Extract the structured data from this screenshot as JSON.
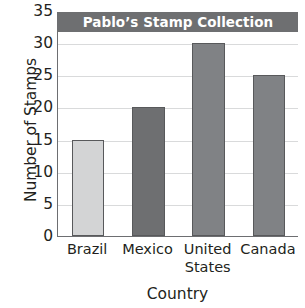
{
  "chart_data": {
    "type": "bar",
    "title": "Pablo’s Stamp Collection",
    "xlabel": "Country",
    "ylabel": "Number of Stamps",
    "categories": [
      "Brazil",
      "Mexico",
      "United States",
      "Canada"
    ],
    "values": [
      15,
      20,
      30,
      25
    ],
    "bar_colors": [
      "#d3d4d5",
      "#6e6f71",
      "#808285",
      "#808285"
    ],
    "ylim": [
      0,
      35
    ],
    "ytick_labels": [
      "0",
      "5",
      "10",
      "15",
      "20",
      "25",
      "30",
      "35"
    ],
    "ytick_values": [
      0,
      5,
      10,
      15,
      20,
      25,
      30,
      35
    ],
    "grid": true,
    "grid_axis": "y",
    "legend": false,
    "title_band_color": "#6e6f71",
    "title_text_color": "#ffffff",
    "axis_color": "#6d6e71",
    "gridline_color": "#d9dadb",
    "bar_outline_color": "#58595b"
  }
}
